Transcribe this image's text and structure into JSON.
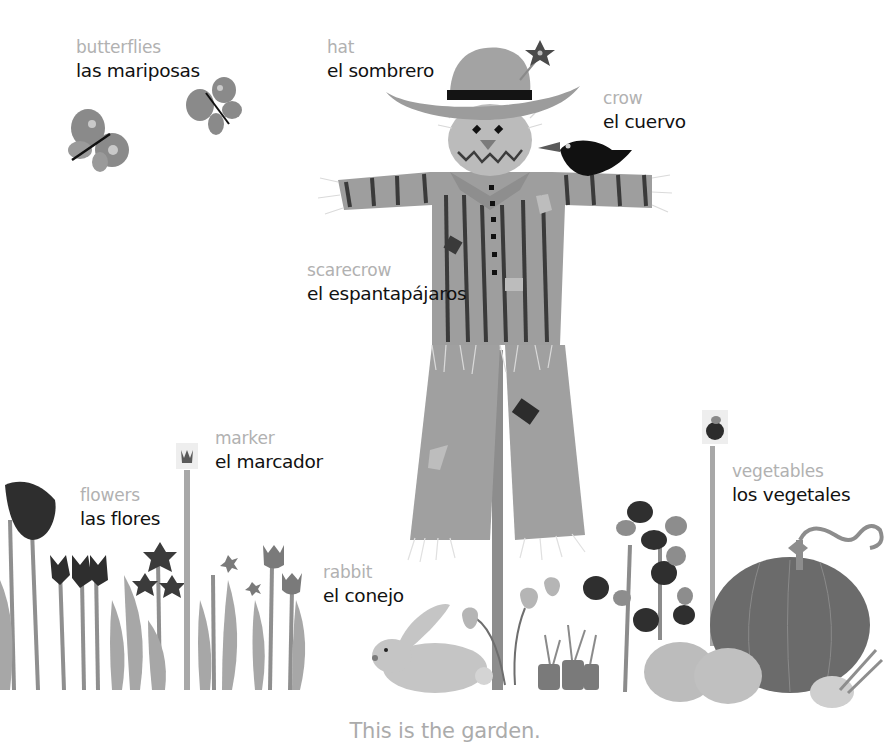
{
  "page": {
    "caption": "This is the garden."
  },
  "labels": {
    "butterflies": {
      "en": "butterflies",
      "es": "las mariposas"
    },
    "hat": {
      "en": "hat",
      "es": "el sombrero"
    },
    "crow": {
      "en": "crow",
      "es": "el cuervo"
    },
    "scarecrow": {
      "en": "scarecrow",
      "es": "el espantapájaros"
    },
    "marker": {
      "en": "marker",
      "es": "el marcador"
    },
    "flowers": {
      "en": "flowers",
      "es": "las flores"
    },
    "rabbit": {
      "en": "rabbit",
      "es": "el conejo"
    },
    "vegetables": {
      "en": "vegetables",
      "es": "los vegetales"
    }
  },
  "illustration": {
    "items": [
      "butterflies",
      "scarecrow",
      "hat",
      "crow",
      "flowers",
      "marker",
      "rabbit",
      "carrots",
      "peppers",
      "vegetable-plants",
      "pumpkin",
      "squash"
    ],
    "colors": {
      "english_label": "#b1b1b1",
      "spanish_label": "#111111",
      "caption": "#ababab",
      "fabric": "#9c9c9c",
      "stripe": "#3a3a3a",
      "dark": "#1c1c1c",
      "light": "#c8c8c8"
    }
  }
}
